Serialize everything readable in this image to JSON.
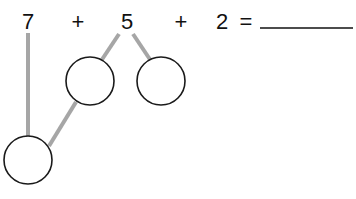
{
  "equation": {
    "terms": [
      "7",
      "+",
      "5",
      "+",
      "2",
      "="
    ],
    "answer_blank": ""
  },
  "diagram": {
    "empty_circles": 3,
    "line_color": "#a6a6a6",
    "circle_stroke": "#1a1a1a"
  }
}
